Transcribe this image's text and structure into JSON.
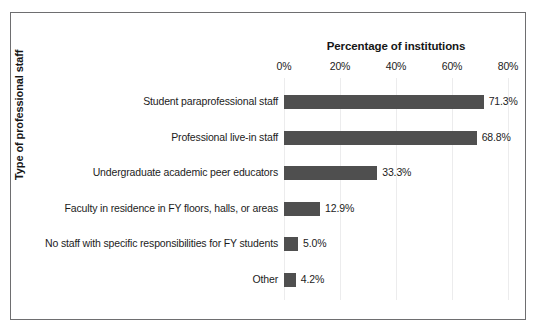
{
  "chart_data": {
    "type": "bar",
    "orientation": "horizontal",
    "title": "",
    "xlabel": "Percentage of institutions",
    "ylabel": "Type of professional staff",
    "xlim": [
      0,
      80
    ],
    "xticks": [
      "0%",
      "20%",
      "40%",
      "60%",
      "80%"
    ],
    "xtick_values": [
      0,
      20,
      40,
      60,
      80
    ],
    "grid": true,
    "legend": "none",
    "bar_color": "#4f4f4f",
    "categories": [
      "Student paraprofessional staff",
      "Professional live-in staff",
      "Undergraduate academic peer educators",
      "Faculty in residence in FY floors, halls, or areas",
      "No staff with specific responsibilities for FY students",
      "Other"
    ],
    "values": [
      71.3,
      68.8,
      33.3,
      12.9,
      5.0,
      4.2
    ],
    "value_labels": [
      "71.3%",
      "68.8%",
      "33.3%",
      "12.9%",
      "5.0%",
      "4.2%"
    ]
  }
}
